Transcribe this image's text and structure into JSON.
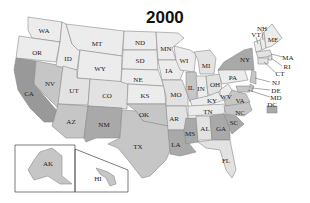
{
  "title": "2000",
  "shades": {
    "light": "#e2e2e2",
    "lighter": "#ececec",
    "medium": "#c6c6c6",
    "dark": "#a9a9a9",
    "darker": "#999999"
  },
  "states": [
    {
      "code": "WA",
      "shade": "lighter"
    },
    {
      "code": "OR",
      "shade": "lighter"
    },
    {
      "code": "CA",
      "shade": "darker"
    },
    {
      "code": "NV",
      "shade": "medium"
    },
    {
      "code": "ID",
      "shade": "lighter"
    },
    {
      "code": "MT",
      "shade": "lighter"
    },
    {
      "code": "WY",
      "shade": "lighter"
    },
    {
      "code": "UT",
      "shade": "light"
    },
    {
      "code": "AZ",
      "shade": "medium"
    },
    {
      "code": "CO",
      "shade": "light"
    },
    {
      "code": "NM",
      "shade": "dark"
    },
    {
      "code": "ND",
      "shade": "lighter"
    },
    {
      "code": "SD",
      "shade": "lighter"
    },
    {
      "code": "NE",
      "shade": "lighter"
    },
    {
      "code": "KS",
      "shade": "lighter"
    },
    {
      "code": "OK",
      "shade": "medium"
    },
    {
      "code": "TX",
      "shade": "medium"
    },
    {
      "code": "MN",
      "shade": "lighter"
    },
    {
      "code": "IA",
      "shade": "lighter"
    },
    {
      "code": "MO",
      "shade": "light"
    },
    {
      "code": "AR",
      "shade": "light"
    },
    {
      "code": "LA",
      "shade": "dark"
    },
    {
      "code": "WI",
      "shade": "lighter"
    },
    {
      "code": "IL",
      "shade": "medium"
    },
    {
      "code": "MS",
      "shade": "dark"
    },
    {
      "code": "MI",
      "shade": "light"
    },
    {
      "code": "IN",
      "shade": "lighter"
    },
    {
      "code": "OH",
      "shade": "light"
    },
    {
      "code": "KY",
      "shade": "lighter"
    },
    {
      "code": "TN",
      "shade": "lighter"
    },
    {
      "code": "AL",
      "shade": "light"
    },
    {
      "code": "GA",
      "shade": "dark"
    },
    {
      "code": "FL",
      "shade": "light"
    },
    {
      "code": "SC",
      "shade": "dark"
    },
    {
      "code": "NC",
      "shade": "medium"
    },
    {
      "code": "VA",
      "shade": "medium"
    },
    {
      "code": "WV",
      "shade": "lighter"
    },
    {
      "code": "PA",
      "shade": "lighter"
    },
    {
      "code": "NY",
      "shade": "dark"
    },
    {
      "code": "VT",
      "shade": "lighter"
    },
    {
      "code": "NH",
      "shade": "lighter"
    },
    {
      "code": "ME",
      "shade": "lighter"
    },
    {
      "code": "MA",
      "shade": "light"
    },
    {
      "code": "RI",
      "shade": "light"
    },
    {
      "code": "CT",
      "shade": "light"
    },
    {
      "code": "NJ",
      "shade": "medium"
    },
    {
      "code": "DE",
      "shade": "medium"
    },
    {
      "code": "MD",
      "shade": "medium"
    },
    {
      "code": "DC",
      "shade": "dark"
    },
    {
      "code": "AK",
      "shade": "medium"
    },
    {
      "code": "HI",
      "shade": "medium"
    }
  ]
}
